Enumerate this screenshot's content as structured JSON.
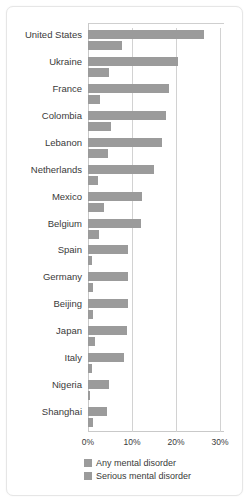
{
  "chart_data": {
    "type": "bar",
    "orientation": "horizontal",
    "title": "",
    "xlabel": "",
    "ylabel": "",
    "xlim": [
      0,
      30
    ],
    "grid": true,
    "gridlines": [
      0,
      10,
      20,
      30
    ],
    "tick_labels": [
      "0%",
      "10%",
      "20%",
      "30%"
    ],
    "legend_position": "bottom",
    "bar_color": "#9b9b9b",
    "categories": [
      "United States",
      "Ukraine",
      "France",
      "Colombia",
      "Lebanon",
      "Netherlands",
      "Mexico",
      "Belgium",
      "Spain",
      "Germany",
      "Beijing",
      "Japan",
      "Italy",
      "Nigeria",
      "Shanghai"
    ],
    "series": [
      {
        "name": "Any mental disorder",
        "values": [
          26.4,
          20.5,
          18.4,
          17.8,
          16.9,
          14.9,
          12.2,
          12.0,
          9.2,
          9.1,
          9.1,
          8.8,
          8.2,
          4.7,
          4.3
        ]
      },
      {
        "name": "Serious mental disorder",
        "values": [
          7.7,
          4.8,
          2.7,
          5.2,
          4.6,
          2.3,
          3.7,
          2.4,
          1.0,
          1.2,
          1.1,
          1.5,
          1.0,
          0.4,
          1.1
        ]
      }
    ]
  },
  "legend": {
    "items": [
      {
        "label": "Any mental disorder",
        "color": "#9b9b9b"
      },
      {
        "label": "Serious mental disorder",
        "color": "#9b9b9b"
      }
    ]
  }
}
